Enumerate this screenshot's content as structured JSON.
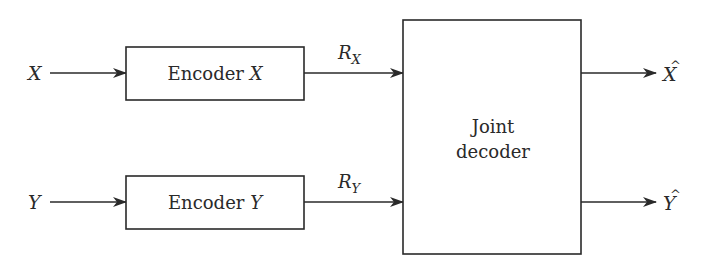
{
  "diagram": {
    "inputs": [
      {
        "label": "X"
      },
      {
        "label": "Y"
      }
    ],
    "encoders": [
      {
        "label": "Encoder ",
        "var": "X"
      },
      {
        "label": "Encoder ",
        "var": "Y"
      }
    ],
    "rates": [
      {
        "base": "R",
        "sub": "X"
      },
      {
        "base": "R",
        "sub": "Y"
      }
    ],
    "decoder": {
      "line1": "Joint",
      "line2": "decoder"
    },
    "outputs": [
      {
        "label": "X",
        "hat": "^"
      },
      {
        "label": "Y",
        "hat": "^"
      }
    ],
    "colors": {
      "stroke": "#2a2a2a",
      "background": "#ffffff"
    }
  }
}
